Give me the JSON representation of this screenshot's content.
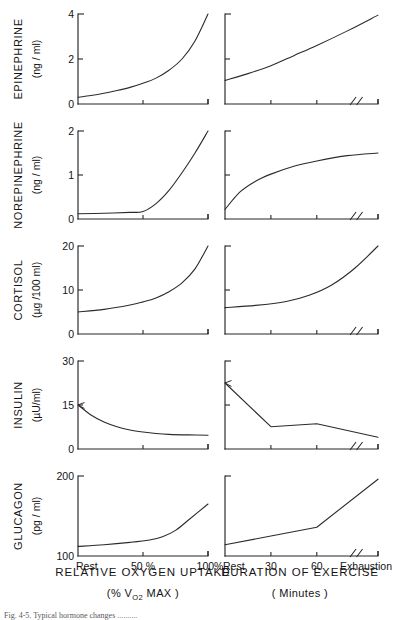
{
  "figure": {
    "background_color": "#ffffff",
    "line_color": "#2b2b2b",
    "text_color": "#141414",
    "caption": "Fig. 4-5.  Typical hormone changes .........."
  },
  "columns": [
    {
      "id": "relative-oxygen-uptake",
      "axis_title": "RELATIVE  OXYGEN  UPTAKE",
      "axis_subtitle_prefix": "(%  V",
      "axis_subtitle_sub": "O",
      "axis_subtitle_sub2": "2",
      "axis_subtitle_suffix": "  MAX )",
      "axis_subtitle_plain": "(% VO2  MAX )",
      "tick_labels": [
        "Rest",
        "50 %",
        "100%"
      ],
      "tick_positions": [
        0,
        50,
        100
      ],
      "has_axis_break": false
    },
    {
      "id": "duration-of-exercise",
      "axis_title": "DURATION OF EXERCISE",
      "axis_subtitle_plain": "( Minutes )",
      "tick_labels": [
        "Rest",
        "30",
        "60",
        "Exhaustion"
      ],
      "tick_positions": [
        0,
        30,
        60,
        100
      ],
      "has_axis_break": true
    }
  ],
  "chart_data": [
    {
      "type": "line",
      "title": "EPINEPHRINE vs Relative Oxygen Uptake",
      "panel": "epinephrine-left",
      "series_label": "EPINEPHRINE",
      "ylabel": "(ng / ml)",
      "xlabel": "RELATIVE OXYGEN UPTAKE (% VO2 MAX)",
      "ylim": [
        0,
        4
      ],
      "yticks": [
        0,
        2,
        4
      ],
      "ytick_labels": [
        "0",
        "2",
        "4"
      ],
      "xlim": [
        0,
        100
      ],
      "xticks": [
        0,
        50,
        100
      ],
      "xtick_labels": [
        "Rest",
        "50 %",
        "100%"
      ],
      "grid": false,
      "x": [
        0,
        10,
        20,
        30,
        40,
        50,
        60,
        70,
        80,
        90,
        100
      ],
      "values": [
        0.3,
        0.38,
        0.48,
        0.6,
        0.74,
        0.92,
        1.15,
        1.5,
        2.0,
        2.8,
        4.0
      ]
    },
    {
      "type": "line",
      "title": "EPINEPHRINE vs Duration of Exercise",
      "panel": "epinephrine-right",
      "series_label": "EPINEPHRINE",
      "ylabel": "(ng / ml)",
      "xlabel": "DURATION OF EXERCISE ( Minutes )",
      "ylim": [
        0,
        4
      ],
      "yticks": [
        0,
        2,
        4
      ],
      "ytick_labels": [
        "0",
        "2",
        "4"
      ],
      "xlim": [
        0,
        100
      ],
      "xticks": [
        0,
        30,
        60,
        100
      ],
      "xtick_labels": [
        "Rest",
        "30",
        "60",
        "Exhaustion"
      ],
      "grid": false,
      "x": [
        0,
        15,
        30,
        45,
        60,
        80,
        100
      ],
      "values": [
        1.05,
        1.35,
        1.7,
        2.15,
        2.6,
        3.25,
        3.95
      ]
    },
    {
      "type": "line",
      "title": "NOREPINEPHRINE vs Relative Oxygen Uptake",
      "panel": "norepinephrine-left",
      "series_label": "NOREPINEPHRINE",
      "ylabel": "(ng / ml)",
      "xlabel": "RELATIVE OXYGEN UPTAKE (% VO2 MAX)",
      "ylim": [
        0,
        2
      ],
      "yticks": [
        0,
        1,
        2
      ],
      "ytick_labels": [
        "0",
        "1",
        "2"
      ],
      "xlim": [
        0,
        100
      ],
      "xticks": [
        0,
        50,
        100
      ],
      "xtick_labels": [
        "Rest",
        "50 %",
        "100%"
      ],
      "grid": false,
      "x": [
        0,
        20,
        40,
        50,
        60,
        70,
        80,
        90,
        100
      ],
      "values": [
        0.12,
        0.13,
        0.15,
        0.17,
        0.35,
        0.65,
        1.05,
        1.5,
        2.0
      ]
    },
    {
      "type": "line",
      "title": "NOREPINEPHRINE vs Duration of Exercise",
      "panel": "norepinephrine-right",
      "series_label": "NOREPINEPHRINE",
      "ylabel": "(ng / ml)",
      "xlabel": "DURATION OF EXERCISE ( Minutes )",
      "ylim": [
        0,
        2
      ],
      "yticks": [
        0,
        1,
        2
      ],
      "ytick_labels": [
        "0",
        "1",
        "2"
      ],
      "xlim": [
        0,
        100
      ],
      "xticks": [
        0,
        30,
        60,
        100
      ],
      "xtick_labels": [
        "Rest",
        "30",
        "60",
        "Exhaustion"
      ],
      "grid": false,
      "x": [
        0,
        10,
        20,
        30,
        45,
        60,
        80,
        100
      ],
      "values": [
        0.22,
        0.62,
        0.86,
        1.02,
        1.2,
        1.32,
        1.44,
        1.5
      ]
    },
    {
      "type": "line",
      "title": "CORTISOL vs Relative Oxygen Uptake",
      "panel": "cortisol-left",
      "series_label": "CORTISOL",
      "ylabel": "(µg /100 ml)",
      "xlabel": "RELATIVE OXYGEN UPTAKE (% VO2 MAX)",
      "ylim": [
        0,
        20
      ],
      "yticks": [
        0,
        10,
        20
      ],
      "ytick_labels": [
        "0",
        "10",
        "20"
      ],
      "xlim": [
        0,
        100
      ],
      "xticks": [
        0,
        50,
        100
      ],
      "xtick_labels": [
        "Rest",
        "50 %",
        "100%"
      ],
      "grid": false,
      "x": [
        0,
        20,
        40,
        50,
        60,
        70,
        80,
        90,
        100
      ],
      "values": [
        5.0,
        5.6,
        6.6,
        7.3,
        8.2,
        9.6,
        11.6,
        14.8,
        20.0
      ]
    },
    {
      "type": "line",
      "title": "CORTISOL vs Duration of Exercise",
      "panel": "cortisol-right",
      "series_label": "CORTISOL",
      "ylabel": "(µg /100 ml)",
      "xlabel": "DURATION OF EXERCISE ( Minutes )",
      "ylim": [
        0,
        20
      ],
      "yticks": [
        0,
        10,
        20
      ],
      "ytick_labels": [
        "0",
        "10",
        "20"
      ],
      "xlim": [
        0,
        100
      ],
      "xticks": [
        0,
        30,
        60,
        100
      ],
      "xtick_labels": [
        "Rest",
        "30",
        "60",
        "Exhaustion"
      ],
      "grid": false,
      "x": [
        0,
        20,
        40,
        55,
        70,
        85,
        100
      ],
      "values": [
        6.0,
        6.5,
        7.4,
        8.8,
        11.2,
        15.0,
        20.0
      ]
    },
    {
      "type": "line",
      "title": "INSULIN vs Relative Oxygen Uptake",
      "panel": "insulin-left",
      "series_label": "INSULIN",
      "ylabel": "(µU/ml)",
      "xlabel": "RELATIVE OXYGEN UPTAKE (% VO2 MAX)",
      "ylim": [
        0,
        30
      ],
      "yticks": [
        0,
        15,
        30
      ],
      "ytick_labels": [
        "0",
        "15",
        "30"
      ],
      "xlim": [
        0,
        100
      ],
      "xticks": [
        0,
        50,
        100
      ],
      "xtick_labels": [
        "Rest",
        "50 %",
        "100%"
      ],
      "grid": false,
      "has_arrow_marker": true,
      "x": [
        0,
        10,
        20,
        30,
        40,
        50,
        60,
        70,
        85,
        100
      ],
      "values": [
        15.0,
        11.6,
        9.2,
        7.6,
        6.5,
        5.8,
        5.3,
        5.0,
        4.8,
        4.7
      ]
    },
    {
      "type": "line",
      "title": "INSULIN vs Duration of Exercise",
      "panel": "insulin-right",
      "series_label": "INSULIN",
      "ylabel": "(µU/ml)",
      "xlabel": "DURATION OF EXERCISE ( Minutes )",
      "ylim": [
        0,
        30
      ],
      "yticks": [
        0,
        15,
        30
      ],
      "ytick_labels": [
        "0",
        "15",
        "30"
      ],
      "xlim": [
        0,
        100
      ],
      "xticks": [
        0,
        30,
        60,
        100
      ],
      "xtick_labels": [
        "Rest",
        "30",
        "60",
        "Exhaustion"
      ],
      "grid": false,
      "has_arrow_marker": true,
      "x": [
        0,
        30,
        60,
        100
      ],
      "values": [
        22.5,
        7.6,
        8.6,
        4.0
      ]
    },
    {
      "type": "line",
      "title": "GLUCAGON vs Relative Oxygen Uptake",
      "panel": "glucagon-left",
      "series_label": "GLUCAGON",
      "ylabel": "(pg / ml)",
      "xlabel": "RELATIVE OXYGEN UPTAKE (% VO2 MAX)",
      "ylim": [
        100,
        200
      ],
      "yticks": [
        100,
        200
      ],
      "ytick_labels": [
        "100",
        "200"
      ],
      "xlim": [
        0,
        100
      ],
      "xticks": [
        0,
        50,
        100
      ],
      "xtick_labels": [
        "Rest",
        "50 %",
        "100%"
      ],
      "grid": false,
      "x": [
        0,
        20,
        40,
        55,
        65,
        75,
        85,
        100
      ],
      "values": [
        112,
        114,
        117,
        120,
        124,
        132,
        145,
        165
      ]
    },
    {
      "type": "line",
      "title": "GLUCAGON vs Duration of Exercise",
      "panel": "glucagon-right",
      "series_label": "GLUCAGON",
      "ylabel": "(pg / ml)",
      "xlabel": "DURATION OF EXERCISE ( Minutes )",
      "ylim": [
        100,
        200
      ],
      "yticks": [
        100,
        200
      ],
      "ytick_labels": [
        "100",
        "200"
      ],
      "xlim": [
        0,
        100
      ],
      "xticks": [
        0,
        30,
        60,
        100
      ],
      "xtick_labels": [
        "Rest",
        "30",
        "60",
        "Exhaustion"
      ],
      "grid": false,
      "x": [
        0,
        30,
        60,
        100
      ],
      "values": [
        114,
        125,
        136,
        196
      ]
    }
  ],
  "rows": [
    {
      "id": "epinephrine",
      "name": "EPINEPHRINE",
      "unit": "(ng / ml)",
      "ytick_labels": [
        "0",
        "2",
        "4"
      ]
    },
    {
      "id": "norepinephrine",
      "name": "NOREPINEPHRINE",
      "unit": "(ng / ml)",
      "ytick_labels": [
        "0",
        "1",
        "2"
      ]
    },
    {
      "id": "cortisol",
      "name": "CORTISOL",
      "unit": "(µg /100 ml)",
      "ytick_labels": [
        "0",
        "10",
        "20"
      ]
    },
    {
      "id": "insulin",
      "name": "INSULIN",
      "unit": "(µU/ml)",
      "ytick_labels": [
        "0",
        "15",
        "30"
      ]
    },
    {
      "id": "glucagon",
      "name": "GLUCAGON",
      "unit": "(pg / ml)",
      "ytick_labels": [
        "100",
        "200"
      ]
    }
  ]
}
